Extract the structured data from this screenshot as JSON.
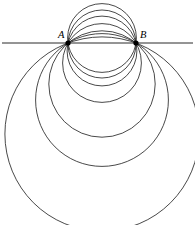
{
  "figure": {
    "background_color": "#ffffff",
    "stroke_color": "#1a1a1a",
    "line_color": "#2b2b2b",
    "width": 195,
    "height": 225
  },
  "points": {
    "a": {
      "label": "A",
      "x": 68,
      "y": 43,
      "label_x": 58,
      "label_y": 38
    },
    "b": {
      "label": "B",
      "x": 136,
      "y": 43,
      "label_x": 140,
      "label_y": 38
    }
  },
  "radical_axis": {
    "name": "horizontal line AB",
    "x1": 2,
    "y1": 43,
    "x2": 193,
    "y2": 43
  },
  "chart_data": {
    "type": "scatter",
    "subtitle": "",
    "xlabel": "",
    "ylabel": "",
    "xlim": [
      0,
      195
    ],
    "ylim": [
      0,
      225
    ],
    "grid": false,
    "legend": null,
    "annotations": [
      "A",
      "B"
    ],
    "fixed_points": [
      {
        "name": "A",
        "x": 68,
        "y": 43
      },
      {
        "name": "B",
        "x": 136,
        "y": 43
      }
    ],
    "half_chord": 34,
    "center_axis_x": 102,
    "series": [
      {
        "name": "circles",
        "description": "Each circle passes through A(68,43) and B(136,43); center lies on x=102 at y=43+k, radius=sqrt(34^2+k^2).",
        "values": [
          {
            "id": "c1",
            "cx": 102,
            "cy": 84,
            "k": 41,
            "r": 53.2,
            "top_y": 30.8,
            "bottom_y": 137.2
          },
          {
            "id": "c2",
            "cx": 102,
            "cy": 100,
            "k": 57,
            "r": 66.4,
            "top_y": 33.6,
            "bottom_y": 166.4
          },
          {
            "id": "c3",
            "cx": 102,
            "cy": 63,
            "k": 20,
            "r": 39.4,
            "top_y": 23.6,
            "bottom_y": 102.4
          },
          {
            "id": "c4",
            "cx": 102,
            "cy": 51,
            "k": 8,
            "r": 34.9,
            "top_y": 16.1,
            "bottom_y": 85.9
          },
          {
            "id": "c5",
            "cx": 102,
            "cy": 44,
            "k": 1,
            "r": 34.0,
            "top_y": 10.0,
            "bottom_y": 78.0
          },
          {
            "id": "c6",
            "cx": 102,
            "cy": 134,
            "k": 91,
            "r": 97.1,
            "top_y": 36.9,
            "bottom_y": 231.1
          },
          {
            "id": "c7",
            "cx": 102,
            "cy": 38,
            "k": -5,
            "r": 34.4,
            "top_y": 3.6,
            "bottom_y": 72.4
          }
        ]
      }
    ]
  },
  "circles": [
    {
      "name": "circle-1-smallest-upper",
      "cx": 102,
      "cy": 38,
      "r": 34.4
    },
    {
      "name": "circle-2",
      "cx": 102,
      "cy": 44,
      "r": 34.0
    },
    {
      "name": "circle-3",
      "cx": 102,
      "cy": 51,
      "r": 34.9
    },
    {
      "name": "circle-4",
      "cx": 102,
      "cy": 63,
      "r": 39.4
    },
    {
      "name": "circle-5",
      "cx": 102,
      "cy": 84,
      "r": 53.2
    },
    {
      "name": "circle-6",
      "cx": 102,
      "cy": 100,
      "r": 66.4
    },
    {
      "name": "circle-7-largest",
      "cx": 102,
      "cy": 134,
      "r": 97.1
    }
  ]
}
